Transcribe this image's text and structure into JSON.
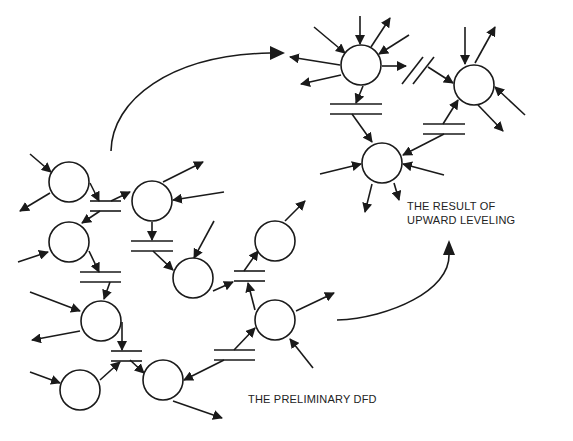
{
  "diagram": {
    "title_preliminary": "THE PRELIMINARY DFD",
    "title_result_line1": "THE RESULT OF",
    "title_result_line2": "UPWARD LEVELING",
    "stroke_color": "#1a1a1a",
    "background": "#ffffff",
    "process_radius": 20
  },
  "result_dfd": {
    "processes": [
      {
        "id": "R1",
        "cx": 361,
        "cy": 65
      },
      {
        "id": "R2",
        "cx": 474,
        "cy": 85
      },
      {
        "id": "R3",
        "cx": 382,
        "cy": 163
      }
    ],
    "stores": [
      {
        "id": "RS1",
        "x1": 330,
        "x2": 382,
        "y1": 104,
        "y2": 114
      },
      {
        "id": "RS2",
        "x1": 423,
        "x2": 465,
        "y1": 124,
        "y2": 134
      }
    ],
    "interrupted_flow_marks": [
      {
        "x1": 402,
        "y1": 84,
        "x2": 423,
        "y2": 57
      },
      {
        "x1": 413,
        "y1": 84,
        "x2": 434,
        "y2": 57
      }
    ],
    "arrows": [
      {
        "x1": 314,
        "y1": 27,
        "x2": 345,
        "y2": 53
      },
      {
        "x1": 360,
        "y1": 16,
        "x2": 360,
        "y2": 44
      },
      {
        "x1": 371,
        "y1": 47,
        "x2": 390,
        "y2": 18
      },
      {
        "x1": 409,
        "y1": 35,
        "x2": 379,
        "y2": 54
      },
      {
        "x1": 340,
        "y1": 65,
        "x2": 290,
        "y2": 57
      },
      {
        "x1": 341,
        "y1": 75,
        "x2": 301,
        "y2": 84
      },
      {
        "x1": 382,
        "y1": 66,
        "x2": 406,
        "y2": 66
      },
      {
        "x1": 428,
        "y1": 67,
        "x2": 453,
        "y2": 83
      },
      {
        "x1": 363,
        "y1": 86,
        "x2": 356,
        "y2": 103
      },
      {
        "x1": 352,
        "y1": 114,
        "x2": 372,
        "y2": 142
      },
      {
        "x1": 443,
        "y1": 124,
        "x2": 458,
        "y2": 100
      },
      {
        "x1": 444,
        "y1": 134,
        "x2": 403,
        "y2": 155
      },
      {
        "x1": 465,
        "y1": 27,
        "x2": 465,
        "y2": 64
      },
      {
        "x1": 475,
        "y1": 63,
        "x2": 495,
        "y2": 27
      },
      {
        "x1": 525,
        "y1": 115,
        "x2": 495,
        "y2": 87
      },
      {
        "x1": 478,
        "y1": 105,
        "x2": 503,
        "y2": 131
      },
      {
        "x1": 320,
        "y1": 174,
        "x2": 361,
        "y2": 164
      },
      {
        "x1": 444,
        "y1": 175,
        "x2": 403,
        "y2": 164
      },
      {
        "x1": 372,
        "y1": 184,
        "x2": 365,
        "y2": 212
      },
      {
        "x1": 394,
        "y1": 183,
        "x2": 399,
        "y2": 200
      }
    ]
  },
  "preliminary_dfd": {
    "processes": [
      {
        "id": "A",
        "cx": 69,
        "cy": 182
      },
      {
        "id": "B",
        "cx": 69,
        "cy": 242
      },
      {
        "id": "C",
        "cx": 152,
        "cy": 201
      },
      {
        "id": "D",
        "cx": 193,
        "cy": 278
      },
      {
        "id": "E",
        "cx": 101,
        "cy": 321
      },
      {
        "id": "F",
        "cx": 163,
        "cy": 380
      },
      {
        "id": "G",
        "cx": 80,
        "cy": 390
      },
      {
        "id": "H",
        "cx": 275,
        "cy": 241
      },
      {
        "id": "I",
        "cx": 275,
        "cy": 320
      }
    ],
    "stores": [
      {
        "id": "S1",
        "x1": 90,
        "x2": 121,
        "y1": 201,
        "y2": 211
      },
      {
        "id": "S2",
        "x1": 80,
        "x2": 121,
        "y1": 272,
        "y2": 282
      },
      {
        "id": "S3",
        "x1": 131,
        "x2": 173,
        "y1": 241,
        "y2": 251
      },
      {
        "id": "S4",
        "x1": 111,
        "x2": 142,
        "y1": 351,
        "y2": 361
      },
      {
        "id": "S5",
        "x1": 234,
        "x2": 265,
        "y1": 271,
        "y2": 281
      },
      {
        "id": "S6",
        "x1": 214,
        "x2": 255,
        "y1": 350,
        "y2": 360
      }
    ],
    "arrows": [
      {
        "x1": 30,
        "y1": 154,
        "x2": 51,
        "y2": 172
      },
      {
        "x1": 50,
        "y1": 193,
        "x2": 20,
        "y2": 211
      },
      {
        "x1": 90,
        "y1": 183,
        "x2": 99,
        "y2": 201
      },
      {
        "x1": 111,
        "y1": 201,
        "x2": 130,
        "y2": 192
      },
      {
        "x1": 100,
        "y1": 211,
        "x2": 82,
        "y2": 223
      },
      {
        "x1": 18,
        "y1": 262,
        "x2": 48,
        "y2": 252
      },
      {
        "x1": 89,
        "y1": 251,
        "x2": 99,
        "y2": 272
      },
      {
        "x1": 110,
        "y1": 282,
        "x2": 104,
        "y2": 299
      },
      {
        "x1": 163,
        "y1": 182,
        "x2": 203,
        "y2": 162
      },
      {
        "x1": 224,
        "y1": 192,
        "x2": 173,
        "y2": 200
      },
      {
        "x1": 152,
        "y1": 222,
        "x2": 152,
        "y2": 240
      },
      {
        "x1": 153,
        "y1": 251,
        "x2": 173,
        "y2": 270
      },
      {
        "x1": 214,
        "y1": 221,
        "x2": 194,
        "y2": 258
      },
      {
        "x1": 213,
        "y1": 291,
        "x2": 233,
        "y2": 282
      },
      {
        "x1": 285,
        "y1": 221,
        "x2": 305,
        "y2": 201
      },
      {
        "x1": 244,
        "y1": 271,
        "x2": 258,
        "y2": 251
      },
      {
        "x1": 255,
        "y1": 310,
        "x2": 248,
        "y2": 283
      },
      {
        "x1": 30,
        "y1": 292,
        "x2": 80,
        "y2": 311
      },
      {
        "x1": 80,
        "y1": 331,
        "x2": 32,
        "y2": 340
      },
      {
        "x1": 122,
        "y1": 322,
        "x2": 122,
        "y2": 350
      },
      {
        "x1": 130,
        "y1": 360,
        "x2": 144,
        "y2": 373
      },
      {
        "x1": 100,
        "y1": 380,
        "x2": 120,
        "y2": 362
      },
      {
        "x1": 30,
        "y1": 372,
        "x2": 60,
        "y2": 383
      },
      {
        "x1": 173,
        "y1": 401,
        "x2": 222,
        "y2": 418
      },
      {
        "x1": 224,
        "y1": 360,
        "x2": 184,
        "y2": 380
      },
      {
        "x1": 234,
        "y1": 350,
        "x2": 255,
        "y2": 328
      },
      {
        "x1": 296,
        "y1": 311,
        "x2": 334,
        "y2": 293
      },
      {
        "x1": 313,
        "y1": 368,
        "x2": 290,
        "y2": 339
      }
    ]
  },
  "leveling_arrows": [
    {
      "id": "curve-up-to-result",
      "path": "M 111 151 C 112 100, 170 55, 270 53",
      "head": {
        "x": 270,
        "y": 53,
        "dir": "right"
      }
    },
    {
      "id": "curve-preliminary-to-result",
      "path": "M 337 320 C 390 318, 450 290, 449 255",
      "head": {
        "x": 449,
        "y": 251,
        "dir": "up"
      }
    }
  ]
}
